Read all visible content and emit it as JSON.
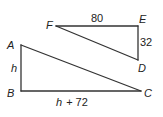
{
  "diagram": {
    "colors": {
      "background": "#ffffff",
      "stroke": "#333333",
      "text": "#222222"
    },
    "triangles": [
      {
        "name": "triangle-ABC",
        "vertices": [
          {
            "label": "A",
            "x": 21,
            "y": 45
          },
          {
            "label": "B",
            "x": 21,
            "y": 91
          },
          {
            "label": "C",
            "x": 141,
            "y": 91
          }
        ],
        "right_angle_at": "B",
        "side_labels": {
          "AB": "h",
          "BC_var": "h",
          "BC_rest": "+ 72"
        }
      },
      {
        "name": "triangle-DEF",
        "vertices": [
          {
            "label": "F",
            "x": 56,
            "y": 26
          },
          {
            "label": "E",
            "x": 138,
            "y": 26
          },
          {
            "label": "D",
            "x": 138,
            "y": 60
          }
        ],
        "right_angle_at": "E",
        "side_labels": {
          "FE": "80",
          "ED": "32"
        }
      }
    ],
    "labels": {
      "A": "A",
      "B": "B",
      "C": "C",
      "D": "D",
      "E": "E",
      "F": "F",
      "AB": "h",
      "BC_var": "h",
      "BC_rest": "+ 72",
      "FE": "80",
      "ED": "32"
    }
  }
}
